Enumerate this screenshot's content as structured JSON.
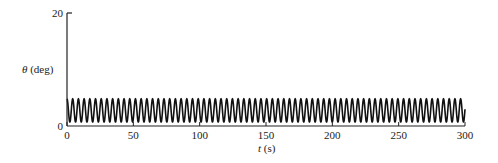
{
  "chart_data": {
    "type": "line",
    "title": "",
    "xlabel": "t (s)",
    "xlabel_var": "t",
    "xlabel_unit": "(s)",
    "ylabel": "θ (deg)",
    "ylabel_var": "θ",
    "ylabel_unit": "(deg)",
    "xlim": [
      0,
      300
    ],
    "ylim": [
      0,
      20
    ],
    "xticks": [
      0,
      50,
      100,
      150,
      200,
      250,
      300
    ],
    "yticks": [
      0,
      20
    ],
    "grid": false,
    "legend": null,
    "series": [
      {
        "name": "theta",
        "description": "Sustained oscillation of θ between roughly 0.7° and 4.8° across the full 0–300 s window",
        "color": "#111111",
        "min": 0.7,
        "max": 4.8,
        "mean": 2.75,
        "period_s": 4.3,
        "initial_value": 4.5
      }
    ]
  }
}
